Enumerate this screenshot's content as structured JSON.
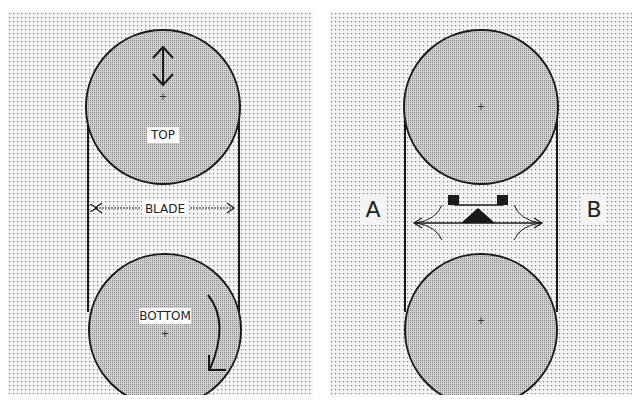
{
  "left_panel": {
    "top_wheel_label": "TOP",
    "bottom_wheel_label": "BOTTOM",
    "blade_label": "BLADE",
    "top_wheel_motion": "vertical-double-arrow",
    "bottom_wheel_motion": "clockwise-arrow"
  },
  "right_panel": {
    "side_a_label": "A",
    "side_b_label": "B",
    "center_element": "blade-guide-assembly"
  },
  "colors": {
    "dot_background": "#f2f2f2",
    "dot_color": "#8a8a8a",
    "wheel_fill": "#b9b9b9",
    "line": "#1a1a1a"
  }
}
